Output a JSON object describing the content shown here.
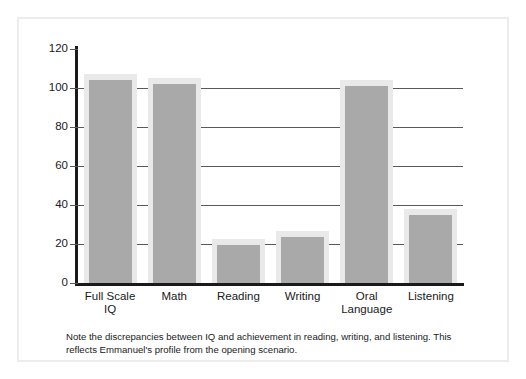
{
  "figure": {
    "caption": "Note the discrepancies between IQ and achievement in reading, writing, and listening. This reflects Emmanuel's profile from the opening scenario."
  },
  "colors": {
    "bar_fill": "#a9a9a9",
    "bar_halo": "#e9e9ea",
    "axis": "#1a1a1a",
    "gridline": "#5a5a5a",
    "frame": "#ececed",
    "background": "#ffffff",
    "text": "#1a1a1a"
  },
  "chart_data": {
    "type": "bar",
    "title": "",
    "subtitle": "",
    "xlabel": "",
    "ylabel": "",
    "categories": [
      "Full Scale\nIQ",
      "Math",
      "Reading",
      "Writing",
      "Oral\nLanguage",
      "Listening"
    ],
    "category_labels": [
      {
        "line1": "Full Scale",
        "line2": "IQ"
      },
      {
        "line1": "Math",
        "line2": ""
      },
      {
        "line1": "Reading",
        "line2": ""
      },
      {
        "line1": "Writing",
        "line2": ""
      },
      {
        "line1": "Oral",
        "line2": "Language"
      },
      {
        "line1": "Listening",
        "line2": ""
      }
    ],
    "values": [
      104,
      102,
      19.5,
      23.5,
      101,
      35
    ],
    "ylim": [
      0,
      120
    ],
    "yticks": [
      0,
      20,
      40,
      60,
      80,
      100,
      120
    ],
    "ytick_labels": [
      "0",
      "20",
      "40",
      "60",
      "80",
      "100",
      "120"
    ],
    "grid": true,
    "grid_axis": "y",
    "legend": null,
    "legend_position": "none",
    "bar_color": "#a9a9a9",
    "annotations": []
  }
}
